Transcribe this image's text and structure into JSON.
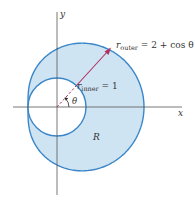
{
  "figure": {
    "axes": {
      "x_label": "x",
      "y_label": "y",
      "axis_color": "#555555"
    },
    "region": {
      "label": "R",
      "fill_color": "#cfe4f3",
      "edge_color": "#3a86c8"
    },
    "curves": {
      "outer": {
        "label_main": "r",
        "label_sub": "outer",
        "label_eq": " = 2 + cos θ",
        "equation": "r = 2 + cos θ"
      },
      "inner": {
        "label_main": "r",
        "label_sub": "inner",
        "label_eq": " = 1",
        "equation": "r = 1"
      }
    },
    "ray": {
      "color": "#b03060",
      "angle_label": "θ"
    }
  }
}
